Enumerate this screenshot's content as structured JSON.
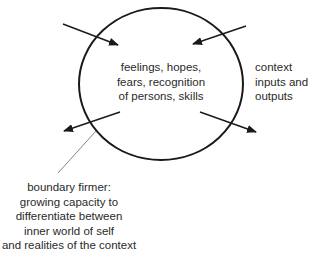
{
  "diagram": {
    "type": "self-boundary diagram",
    "colors": {
      "stroke": "#1a1a1a",
      "leader": "#555555",
      "text": "#2a2a2a",
      "background": "#ffffff"
    },
    "circle": {
      "label_lines": [
        "feelings, hopes,",
        "fears, recognition",
        "of persons, skills"
      ]
    },
    "arrows": [
      {
        "id": "in-top-left",
        "direction": "inward"
      },
      {
        "id": "in-top-right",
        "direction": "inward"
      },
      {
        "id": "out-bottom-left",
        "direction": "outward"
      },
      {
        "id": "out-bottom-right",
        "direction": "outward"
      }
    ],
    "context_label": {
      "lines": [
        "context",
        "inputs and",
        "outputs"
      ]
    },
    "boundary_label": {
      "lines": [
        "boundary firmer:",
        "growing capacity to",
        "differentiate between",
        "inner world of self",
        "and realities of the context"
      ]
    }
  }
}
